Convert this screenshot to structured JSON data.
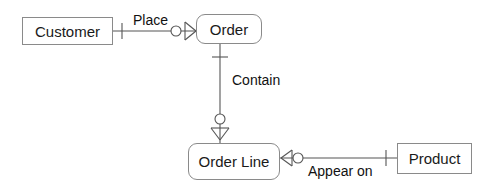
{
  "diagram": {
    "type": "entity-relationship-diagram",
    "notation": "crow's foot",
    "width": 494,
    "height": 192,
    "background_color": "#ffffff",
    "line_color": "#555555",
    "entity_border_color": "#8a8a8a",
    "text_color": "#111111",
    "entities": [
      {
        "id": "customer",
        "label": "Customer",
        "shape": "rectangle",
        "x": 22,
        "y": 17,
        "width": 91,
        "height": 28
      },
      {
        "id": "order",
        "label": "Order",
        "shape": "rounded-rectangle",
        "x": 196,
        "y": 14,
        "width": 66,
        "height": 30
      },
      {
        "id": "order_line",
        "label": "Order Line",
        "shape": "rounded-rectangle",
        "x": 188,
        "y": 143,
        "width": 92,
        "height": 37
      },
      {
        "id": "product",
        "label": "Product",
        "shape": "rectangle",
        "x": 397,
        "y": 143,
        "width": 75,
        "height": 31
      }
    ],
    "relationships": [
      {
        "id": "place",
        "label": "Place",
        "from": "customer",
        "to": "order",
        "from_cardinality": "one",
        "to_cardinality": "zero-or-many",
        "label_x": 133,
        "label_y": 13
      },
      {
        "id": "contain",
        "label": "Contain",
        "from": "order",
        "to": "order_line",
        "from_cardinality": "one",
        "to_cardinality": "zero-or-many",
        "label_x": 232,
        "label_y": 73
      },
      {
        "id": "appear_on",
        "label": "Appear on",
        "from": "order_line",
        "to": "product",
        "from_cardinality": "zero-or-many",
        "to_cardinality": "one",
        "label_x": 308,
        "label_y": 164
      }
    ]
  }
}
